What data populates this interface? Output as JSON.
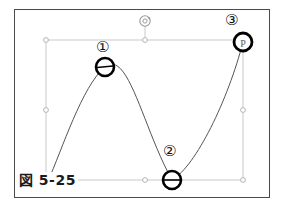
{
  "figure": {
    "caption": "図 5-25",
    "frame": {
      "x": 14,
      "y": 9,
      "width": 256,
      "height": 189,
      "border_color": "#4a4a4a"
    },
    "background_color": "#ffffff"
  },
  "selection": {
    "name": "path-selection-bounding-box",
    "color": "#c9c9c9",
    "box": {
      "left": 46,
      "top": 40,
      "right": 243,
      "bottom": 180
    },
    "handles": [
      {
        "name": "handle-top-left",
        "x": 46,
        "y": 40,
        "shape": "circle"
      },
      {
        "name": "handle-top-center",
        "x": 145,
        "y": 40,
        "shape": "circle"
      },
      {
        "name": "handle-top-right",
        "x": 243,
        "y": 40,
        "shape": "circle"
      },
      {
        "name": "handle-middle-left",
        "x": 46,
        "y": 110,
        "shape": "circle"
      },
      {
        "name": "handle-middle-right",
        "x": 243,
        "y": 110,
        "shape": "circle"
      },
      {
        "name": "handle-bottom-left",
        "x": 46,
        "y": 180,
        "shape": "circle"
      },
      {
        "name": "handle-bottom-center",
        "x": 145,
        "y": 180,
        "shape": "circle"
      },
      {
        "name": "handle-bottom-right",
        "x": 243,
        "y": 180,
        "shape": "circle"
      }
    ],
    "rotation_handle": {
      "name": "rotate-handle",
      "x": 145,
      "y": 22,
      "icon": "rotate-icon",
      "stem_from_y": 40
    }
  },
  "curve": {
    "name": "bezier-curve",
    "stroke_color": "#555555",
    "stroke_width": 1,
    "path": "M 48 181 C 62 150 82 86 105 67 C 128 48 143 128 172 180 C 196 166 228 100 243 42",
    "start_point": {
      "x": 48,
      "y": 181
    },
    "end_point": {
      "x": 243,
      "y": 42
    }
  },
  "anchor_points": [
    {
      "id": "anchor-point-1",
      "number": "①",
      "x": 105,
      "y": 67,
      "radius": 9,
      "has_tangent_bar": true,
      "label_x": 96,
      "label_y": 40
    },
    {
      "id": "anchor-point-2",
      "number": "②",
      "x": 172,
      "y": 180,
      "radius": 9,
      "has_tangent_bar": true,
      "label_x": 163,
      "label_y": 144
    },
    {
      "id": "anchor-point-3",
      "number": "③",
      "x": 243,
      "y": 42,
      "radius": 9,
      "has_tangent_bar": false,
      "label_x": 225,
      "label_y": 13
    }
  ],
  "cursor": {
    "name": "pen-tool-cursor",
    "glyph": "P",
    "x": 243,
    "y": 42,
    "color": "#555555"
  },
  "colors": {
    "frame_border": "#4a4a4a",
    "selection_guide": "#c9c9c9",
    "curve_stroke": "#555555",
    "anchor_stroke": "#000000",
    "caption_text": "#1a1a1a"
  }
}
